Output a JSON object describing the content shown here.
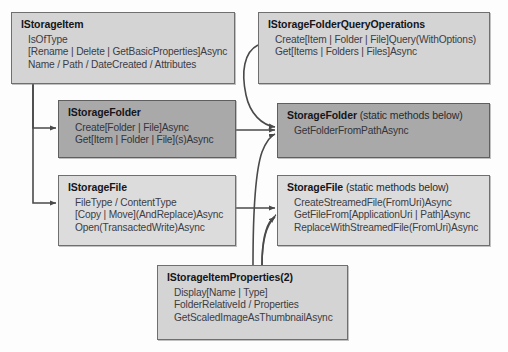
{
  "diagram": {
    "colors": {
      "node_fill_light": "#d4d4d4",
      "node_fill_dark": "#a9a9a9",
      "node_border": "#6f6f6f",
      "edge": "#4a4a4a",
      "background": "#fdfdfd"
    },
    "nodes": [
      {
        "id": "istorageitem",
        "title": "IStorageItem",
        "subtitle": "",
        "lines": [
          "IsOfType",
          "[Rename | Delete | GetBasicProperties]Async",
          "Name / Path / DateCreated / Attributes"
        ]
      },
      {
        "id": "iqueryops",
        "title": "IStorageFolderQueryOperations",
        "subtitle": "",
        "lines": [
          "Create[Item | Folder | File]Query(WithOptions)",
          "Get[Items | Folders | Files]Async"
        ]
      },
      {
        "id": "istoragefolder",
        "title": "IStorageFolder",
        "subtitle": "",
        "lines": [
          "Create[Folder | File]Async",
          "Get[Item | Folder | File](s)Async"
        ]
      },
      {
        "id": "storagefolder",
        "title": "StorageFolder",
        "subtitle": "(static methods below)",
        "lines": [
          "GetFolderFromPathAsync"
        ]
      },
      {
        "id": "istoragefile",
        "title": "IStorageFile",
        "subtitle": "",
        "lines": [
          "FileType / ContentType",
          "[Copy | Move](AndReplace)Async",
          "Open(TransactedWrite)Async"
        ]
      },
      {
        "id": "storagefile",
        "title": "StorageFile",
        "subtitle": "(static methods below)",
        "lines": [
          "CreateStreamedFile(FromUri)Async",
          "GetFileFrom[ApplicationUri | Path]Async",
          "ReplaceWithStreamedFile(FromUri)Async"
        ]
      },
      {
        "id": "iprops",
        "title": "IStorageItemProperties(2)",
        "subtitle": "",
        "lines": [
          "Display[Name | Type]",
          "FolderRelativeId / Properties",
          "GetScaledImageAsThumbnailAsync"
        ]
      }
    ],
    "edges": [
      {
        "from": "istorageitem",
        "to": "istoragefolder",
        "style": "orthogonal"
      },
      {
        "from": "istorageitem",
        "to": "istoragefile",
        "style": "orthogonal"
      },
      {
        "from": "iqueryops",
        "to": "storagefolder",
        "style": "curved"
      },
      {
        "from": "istoragefolder",
        "to": "storagefolder",
        "style": "straight"
      },
      {
        "from": "iprops",
        "to": "storagefolder",
        "style": "curved"
      },
      {
        "from": "istoragefile",
        "to": "storagefile",
        "style": "straight"
      },
      {
        "from": "iprops",
        "to": "storagefile",
        "style": "curved"
      }
    ]
  }
}
